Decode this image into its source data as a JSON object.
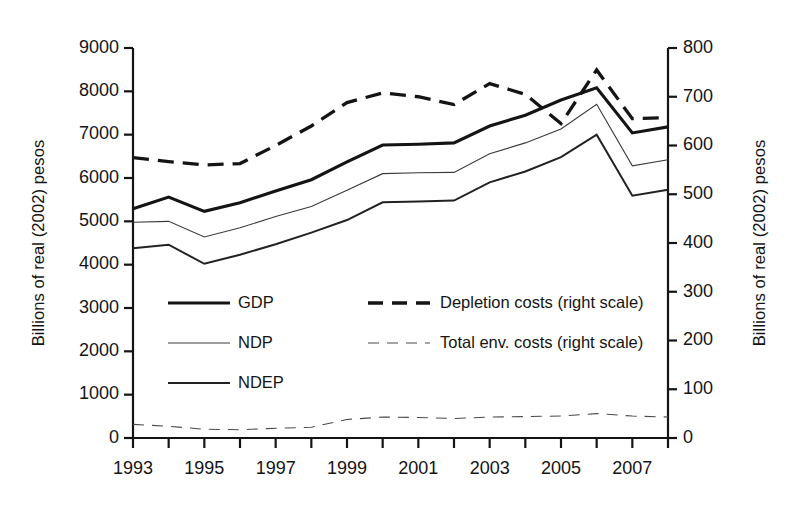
{
  "chart_data": {
    "type": "line",
    "title": "",
    "xlabel": "",
    "ylabel": "Billions of real (2002) pesos",
    "ylabel_right": "Billions of real (2002) pesos",
    "grid": false,
    "legend_position": "inside-center-left",
    "x": [
      1993,
      1994,
      1995,
      1996,
      1997,
      1998,
      1999,
      2000,
      2001,
      2002,
      2003,
      2004,
      2005,
      2006,
      2007,
      2008
    ],
    "xlim": [
      1993,
      2008
    ],
    "xticks": [
      1993,
      1994,
      1995,
      1996,
      1997,
      1998,
      1999,
      2000,
      2001,
      2002,
      2003,
      2004,
      2005,
      2006,
      2007,
      2008
    ],
    "xticklabels": [
      "1993",
      "",
      "1995",
      "",
      "1997",
      "",
      "1999",
      "",
      "2001",
      "",
      "2003",
      "",
      "2005",
      "",
      "2007",
      ""
    ],
    "xticklabels_shown": [
      "1993",
      "1995",
      "1997",
      "1999",
      "2001",
      "2003",
      "2005",
      "2007"
    ],
    "ylim": [
      0,
      9000
    ],
    "yticks": [
      0,
      1000,
      2000,
      3000,
      4000,
      5000,
      6000,
      7000,
      8000,
      9000
    ],
    "yticklabels": [
      "0",
      "1000",
      "2000",
      "3000",
      "4000",
      "5000",
      "6000",
      "7000",
      "8000",
      "9000"
    ],
    "ylim_right": [
      0,
      800
    ],
    "yticks_right": [
      0,
      100,
      200,
      300,
      400,
      500,
      600,
      700,
      800
    ],
    "yticklabels_right": [
      "0",
      "100",
      "200",
      "300",
      "400",
      "500",
      "600",
      "700",
      "800"
    ],
    "series": [
      {
        "name": "GDP",
        "axis": "left",
        "style": "solid",
        "width": 3.1,
        "color": "#141414",
        "values": [
          5290,
          5560,
          5230,
          5430,
          5700,
          5960,
          6370,
          6760,
          6780,
          6810,
          7200,
          7450,
          7800,
          8080,
          7040,
          7180
        ]
      },
      {
        "name": "NDP",
        "axis": "left",
        "style": "solid",
        "width": 1.1,
        "color": "#3a3a3a",
        "values": [
          4980,
          5000,
          4640,
          4850,
          5110,
          5340,
          5720,
          6100,
          6120,
          6130,
          6560,
          6810,
          7130,
          7700,
          6280,
          6420
        ]
      },
      {
        "name": "NDEP",
        "axis": "left",
        "style": "solid",
        "width": 2.0,
        "color": "#222222",
        "values": [
          4380,
          4460,
          4020,
          4230,
          4470,
          4740,
          5030,
          5440,
          5460,
          5480,
          5900,
          6150,
          6480,
          7000,
          5590,
          5730
        ]
      },
      {
        "name": "Depletion costs (right scale)",
        "axis": "right",
        "style": "dashed",
        "width": 3.3,
        "color": "#141414",
        "values": [
          575,
          567,
          560,
          563,
          600,
          640,
          688,
          708,
          700,
          684,
          727,
          705,
          645,
          755,
          655,
          657
        ]
      },
      {
        "name": "Total env. costs (right scale)",
        "axis": "right",
        "style": "dashed",
        "width": 1.1,
        "color": "#4a4a4a",
        "values": [
          28,
          24,
          18,
          17,
          20,
          22,
          38,
          43,
          42,
          40,
          43,
          44,
          45,
          50,
          45,
          43
        ]
      }
    ]
  },
  "legend": {
    "items": [
      {
        "label": "GDP",
        "style": "solid-thick"
      },
      {
        "label": "NDP",
        "style": "solid-thin"
      },
      {
        "label": "NDEP",
        "style": "solid-medium"
      },
      {
        "label": "Depletion costs (right scale)",
        "style": "dashed-thick"
      },
      {
        "label": "Total env. costs (right scale)",
        "style": "dashed-thin"
      }
    ]
  },
  "axes": {
    "left_title": "Billions of real (2002) pesos",
    "right_title": "Billions of real (2002) pesos"
  },
  "colors": {
    "line": "#141414",
    "thin_line": "#4a4a4a",
    "background": "#ffffff",
    "axis": "#141414"
  }
}
